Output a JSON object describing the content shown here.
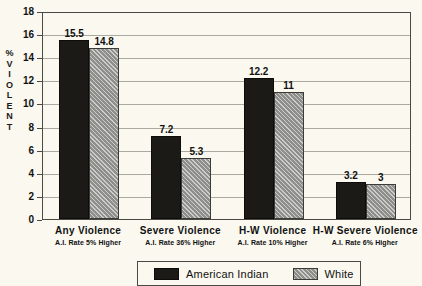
{
  "chart_data": {
    "type": "bar",
    "title": "",
    "subtitle": "",
    "xlabel": "",
    "ylabel": "% VIOLENT",
    "ylabel_chars": [
      "%",
      "V",
      "I",
      "O",
      "L",
      "E",
      "N",
      "T"
    ],
    "ylim": [
      0,
      18
    ],
    "yticks": [
      18,
      16,
      14,
      12,
      10,
      8,
      6,
      4,
      2,
      0
    ],
    "grid": true,
    "grid_axis": "y",
    "legend_position": "bottom",
    "categories": [
      "Any Violence",
      "Severe Violence",
      "H-W Violence",
      "H-W Severe Violence"
    ],
    "category_notes": [
      "A.I. Rate 5% Higher",
      "A.I. Rate 36% Higher",
      "A.I. Rate 10% Higher",
      "A.I. Rate 6% Higher"
    ],
    "series": [
      {
        "name": "American Indian",
        "color": "#1c1a17",
        "values": [
          15.5,
          7.2,
          12.2,
          3.2
        ],
        "labels": [
          "15.5",
          "7.2",
          "12.2",
          "3.2"
        ]
      },
      {
        "name": "White",
        "color": "#8e8e8a",
        "values": [
          14.8,
          5.3,
          11,
          3
        ],
        "labels": [
          "14.8",
          "5.3",
          "11",
          "3"
        ]
      }
    ]
  },
  "legend": {
    "items": [
      {
        "label": "American Indian",
        "swatch": "black-solid-swatch"
      },
      {
        "label": "White",
        "swatch": "gray-hatched-swatch"
      }
    ]
  },
  "colors": {
    "background": "#faf8ef",
    "axis": "#4a4a44",
    "gridline": "#a9a9a0",
    "series_american_indian": "#1c1a17",
    "series_white": "#8e8e8a",
    "text": "#111111"
  }
}
